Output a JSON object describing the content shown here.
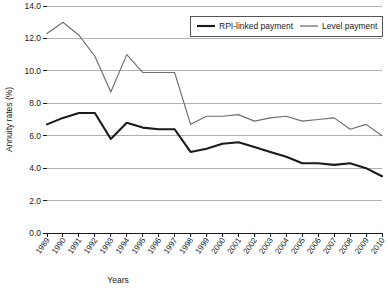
{
  "chart_data": {
    "type": "line",
    "title": "",
    "xlabel": "Years",
    "ylabel": "Annuity rates (%)",
    "ylim": [
      0.0,
      14.0
    ],
    "ytick_labels": [
      "14.0",
      "12.0",
      "10.0",
      "8.0",
      "6.0",
      "4.0",
      "2.0",
      "0.0"
    ],
    "ytick_values": [
      14.0,
      12.0,
      10.0,
      8.0,
      6.0,
      4.0,
      2.0,
      0.0
    ],
    "grid": "horizontal",
    "legend_position": "top-right",
    "categories": [
      "1989",
      "1990",
      "1991",
      "1992",
      "1993",
      "1994",
      "1995",
      "1996",
      "1997",
      "1998",
      "1999",
      "2000",
      "2001",
      "2002",
      "2003",
      "2004",
      "2005",
      "2006",
      "2007",
      "2008",
      "2009",
      "2010"
    ],
    "x": [
      1989,
      1990,
      1991,
      1992,
      1993,
      1994,
      1995,
      1996,
      1997,
      1998,
      1999,
      2000,
      2001,
      2002,
      2003,
      2004,
      2005,
      2006,
      2007,
      2008,
      2009,
      2010
    ],
    "series": [
      {
        "name": "RPI-linked payment",
        "color": "#1a1a1a",
        "values": [
          6.7,
          7.1,
          7.4,
          7.4,
          5.8,
          6.8,
          6.5,
          6.4,
          6.4,
          5.0,
          5.2,
          5.5,
          5.6,
          5.3,
          5.0,
          4.7,
          4.3,
          4.3,
          4.2,
          4.3,
          4.0,
          3.5
        ]
      },
      {
        "name": "Level payment",
        "color": "#6e6e6e",
        "values": [
          12.3,
          13.0,
          12.2,
          10.9,
          8.7,
          11.0,
          9.9,
          9.9,
          9.9,
          6.7,
          7.2,
          7.2,
          7.3,
          6.9,
          7.1,
          7.2,
          6.9,
          7.0,
          7.1,
          6.4,
          6.7,
          6.0
        ]
      }
    ]
  },
  "legend": {
    "entries": [
      {
        "label": "RPI-linked payment"
      },
      {
        "label": "Level payment"
      }
    ]
  },
  "axes": {
    "y_title": "Annuity rates (%)",
    "x_title": "Years"
  }
}
